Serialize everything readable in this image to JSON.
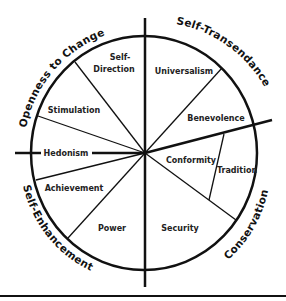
{
  "diagram": {
    "colors": {
      "line": "#111111",
      "text": "#222222",
      "background": "#ffffff"
    },
    "quadrants": [
      {
        "id": "openness",
        "label": "Openness to Change"
      },
      {
        "id": "self-transcendence",
        "label": "Self-Transendance"
      },
      {
        "id": "self-enhancement",
        "label": "Self-Enhancement"
      },
      {
        "id": "conservation",
        "label": "Conservation"
      }
    ],
    "values": [
      {
        "id": "self-direction",
        "line1": "Self-",
        "line2": "Direction"
      },
      {
        "id": "stimulation",
        "label": "Stimulation"
      },
      {
        "id": "hedonism",
        "label": "Hedonism"
      },
      {
        "id": "achievement",
        "label": "Achievement"
      },
      {
        "id": "power",
        "label": "Power"
      },
      {
        "id": "security",
        "label": "Security"
      },
      {
        "id": "conformity",
        "label": "Conformity"
      },
      {
        "id": "tradition",
        "label": "Tradition"
      },
      {
        "id": "benevolence",
        "label": "Benevolence"
      },
      {
        "id": "universalism",
        "label": "Universalism"
      }
    ]
  }
}
